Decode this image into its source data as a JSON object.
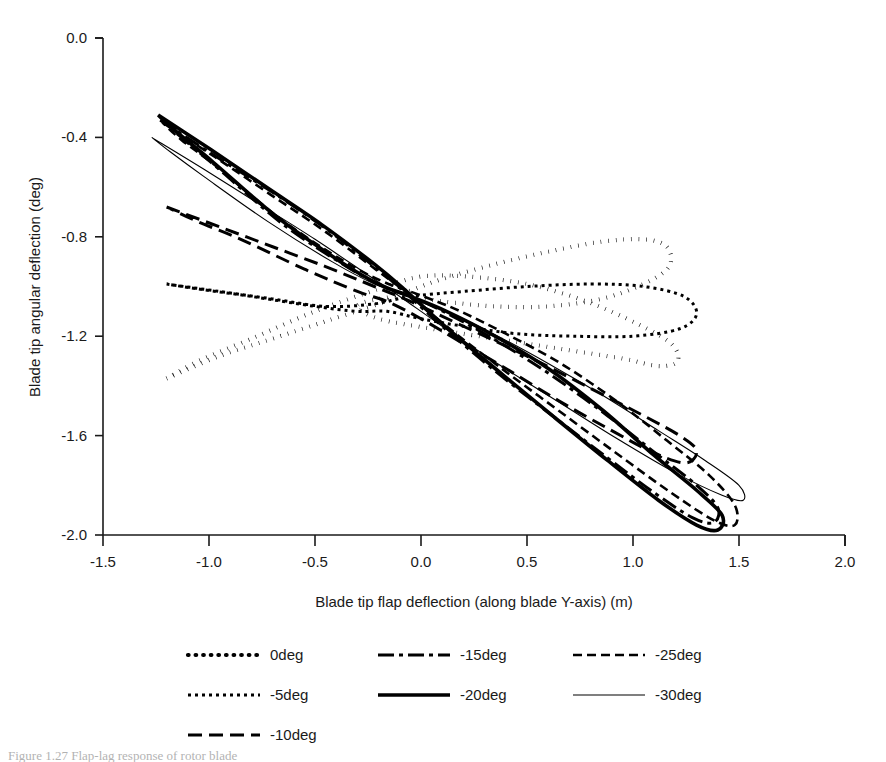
{
  "chart_data": {
    "type": "line",
    "title": "",
    "xlabel": "Blade tip flap deflection (along blade Y-axis) (m)",
    "ylabel": "Blade tip angular deflection (deg)",
    "xlim": [
      -1.5,
      2.0
    ],
    "ylim": [
      -2.0,
      0.0
    ],
    "xticks": [
      "-1.5",
      "-1.0",
      "-0.5",
      "0.0",
      "0.5",
      "1.0",
      "1.5",
      "2.0"
    ],
    "xtick_values": [
      -1.5,
      -1.0,
      -0.5,
      0.0,
      0.5,
      1.0,
      1.5,
      2.0
    ],
    "yticks": [
      "0.0",
      "-0.4",
      "-0.8",
      "-1.2",
      "-1.6",
      "-2.0"
    ],
    "ytick_values": [
      0.0,
      -0.4,
      -0.8,
      -1.2,
      -1.6,
      -2.0
    ],
    "grid": false,
    "legend_position": "bottom",
    "legend_columns": 3,
    "series": [
      {
        "name": "0deg",
        "style": "dotted-bold",
        "description": "bow-tie / figure-eight loop, two lobes extending right",
        "points": [
          [
            -1.2,
            -1.37
          ],
          [
            -0.95,
            -1.28
          ],
          [
            -0.7,
            -1.21
          ],
          [
            -0.45,
            -1.14
          ],
          [
            -0.2,
            -1.07
          ],
          [
            -0.06,
            -1.02
          ],
          [
            0.1,
            -0.97
          ],
          [
            0.35,
            -0.91
          ],
          [
            0.6,
            -0.86
          ],
          [
            0.85,
            -0.82
          ],
          [
            1.05,
            -0.81
          ],
          [
            1.16,
            -0.84
          ],
          [
            1.17,
            -0.92
          ],
          [
            1.05,
            -0.99
          ],
          [
            0.85,
            -1.05
          ],
          [
            0.6,
            -1.08
          ],
          [
            0.35,
            -1.08
          ],
          [
            0.1,
            -1.06
          ],
          [
            -0.06,
            -1.04
          ],
          [
            -0.2,
            -1.05
          ],
          [
            -0.3,
            -1.08
          ],
          [
            -0.2,
            -1.13
          ],
          [
            0.05,
            -1.17
          ],
          [
            0.35,
            -1.21
          ],
          [
            0.65,
            -1.25
          ],
          [
            0.95,
            -1.29
          ],
          [
            1.12,
            -1.32
          ],
          [
            1.21,
            -1.3
          ],
          [
            1.18,
            -1.23
          ],
          [
            1.02,
            -1.15
          ],
          [
            0.78,
            -1.06
          ],
          [
            0.5,
            -0.99
          ],
          [
            0.22,
            -0.96
          ],
          [
            0.0,
            -0.96
          ],
          [
            -0.2,
            -1.01
          ],
          [
            -0.5,
            -1.1
          ],
          [
            -0.8,
            -1.21
          ],
          [
            -1.05,
            -1.3
          ],
          [
            -1.2,
            -1.37
          ]
        ]
      },
      {
        "name": "-5deg",
        "style": "dotted-fine",
        "description": "narrow flattened loop from upper-left to mid-right",
        "points": [
          [
            -1.2,
            -0.99
          ],
          [
            -0.95,
            -1.02
          ],
          [
            -0.7,
            -1.05
          ],
          [
            -0.45,
            -1.08
          ],
          [
            -0.22,
            -1.07
          ],
          [
            -0.05,
            -1.04
          ],
          [
            0.2,
            -1.02
          ],
          [
            0.5,
            -1.0
          ],
          [
            0.8,
            -0.99
          ],
          [
            1.05,
            -1.0
          ],
          [
            1.24,
            -1.04
          ],
          [
            1.3,
            -1.11
          ],
          [
            1.22,
            -1.17
          ],
          [
            1.0,
            -1.2
          ],
          [
            0.72,
            -1.2
          ],
          [
            0.45,
            -1.19
          ],
          [
            0.2,
            -1.16
          ],
          [
            0.0,
            -1.13
          ],
          [
            -0.16,
            -1.1
          ],
          [
            -0.3,
            -1.1
          ],
          [
            -0.5,
            -1.08
          ],
          [
            -0.8,
            -1.04
          ],
          [
            -1.05,
            -1.01
          ],
          [
            -1.2,
            -0.99
          ]
        ]
      },
      {
        "name": "-10deg",
        "style": "long-dash",
        "description": "elongated loop, descending left to lower-right",
        "points": [
          [
            -1.2,
            -0.68
          ],
          [
            -0.95,
            -0.76
          ],
          [
            -0.7,
            -0.84
          ],
          [
            -0.45,
            -0.92
          ],
          [
            -0.22,
            -1.0
          ],
          [
            -0.05,
            -1.06
          ],
          [
            0.2,
            -1.16
          ],
          [
            0.5,
            -1.28
          ],
          [
            0.8,
            -1.41
          ],
          [
            1.05,
            -1.52
          ],
          [
            1.22,
            -1.6
          ],
          [
            1.3,
            -1.66
          ],
          [
            1.25,
            -1.71
          ],
          [
            1.1,
            -1.67
          ],
          [
            0.9,
            -1.58
          ],
          [
            0.65,
            -1.46
          ],
          [
            0.4,
            -1.33
          ],
          [
            0.18,
            -1.22
          ],
          [
            0.0,
            -1.13
          ],
          [
            -0.16,
            -1.06
          ],
          [
            -0.3,
            -1.02
          ],
          [
            -0.55,
            -0.93
          ],
          [
            -0.85,
            -0.81
          ],
          [
            -1.05,
            -0.74
          ],
          [
            -1.2,
            -0.68
          ]
        ]
      },
      {
        "name": "-15deg",
        "style": "dash-dot",
        "description": "steep elongated loop reaching lower right near -1.95",
        "points": [
          [
            -1.23,
            -0.33
          ],
          [
            -0.98,
            -0.47
          ],
          [
            -0.72,
            -0.61
          ],
          [
            -0.46,
            -0.76
          ],
          [
            -0.22,
            -0.92
          ],
          [
            -0.08,
            -1.02
          ],
          [
            0.1,
            -1.16
          ],
          [
            0.35,
            -1.34
          ],
          [
            0.62,
            -1.52
          ],
          [
            0.88,
            -1.69
          ],
          [
            1.1,
            -1.83
          ],
          [
            1.28,
            -1.93
          ],
          [
            1.38,
            -1.95
          ],
          [
            1.4,
            -1.89
          ],
          [
            1.3,
            -1.8
          ],
          [
            1.12,
            -1.68
          ],
          [
            0.88,
            -1.52
          ],
          [
            0.62,
            -1.36
          ],
          [
            0.38,
            -1.23
          ],
          [
            0.15,
            -1.12
          ],
          [
            -0.02,
            -1.05
          ],
          [
            -0.18,
            -1.0
          ],
          [
            -0.35,
            -0.92
          ],
          [
            -0.65,
            -0.75
          ],
          [
            -0.95,
            -0.53
          ],
          [
            -1.13,
            -0.4
          ],
          [
            -1.23,
            -0.33
          ]
        ]
      },
      {
        "name": "-20deg",
        "style": "solid-bold",
        "description": "thickest solid elongated loop, widest vertical span",
        "points": [
          [
            -1.24,
            -0.31
          ],
          [
            -0.99,
            -0.45
          ],
          [
            -0.73,
            -0.6
          ],
          [
            -0.47,
            -0.75
          ],
          [
            -0.22,
            -0.91
          ],
          [
            -0.08,
            -1.01
          ],
          [
            0.1,
            -1.15
          ],
          [
            0.35,
            -1.33
          ],
          [
            0.62,
            -1.52
          ],
          [
            0.88,
            -1.7
          ],
          [
            1.12,
            -1.86
          ],
          [
            1.3,
            -1.96
          ],
          [
            1.4,
            -1.98
          ],
          [
            1.42,
            -1.92
          ],
          [
            1.3,
            -1.82
          ],
          [
            1.1,
            -1.68
          ],
          [
            0.86,
            -1.5
          ],
          [
            0.6,
            -1.33
          ],
          [
            0.35,
            -1.2
          ],
          [
            0.12,
            -1.1
          ],
          [
            -0.05,
            -1.04
          ],
          [
            -0.2,
            -0.99
          ],
          [
            -0.38,
            -0.9
          ],
          [
            -0.68,
            -0.72
          ],
          [
            -0.98,
            -0.5
          ],
          [
            -1.15,
            -0.38
          ],
          [
            -1.24,
            -0.31
          ]
        ]
      },
      {
        "name": "-25deg",
        "style": "dashed",
        "description": "dashed elongated loop overlapping -20deg, reaching x 1.48",
        "points": [
          [
            -1.22,
            -0.34
          ],
          [
            -0.97,
            -0.48
          ],
          [
            -0.71,
            -0.63
          ],
          [
            -0.45,
            -0.78
          ],
          [
            -0.2,
            -0.94
          ],
          [
            -0.06,
            -1.03
          ],
          [
            0.12,
            -1.16
          ],
          [
            0.38,
            -1.33
          ],
          [
            0.65,
            -1.5
          ],
          [
            0.92,
            -1.67
          ],
          [
            1.18,
            -1.83
          ],
          [
            1.38,
            -1.94
          ],
          [
            1.48,
            -1.96
          ],
          [
            1.48,
            -1.88
          ],
          [
            1.36,
            -1.76
          ],
          [
            1.16,
            -1.62
          ],
          [
            0.92,
            -1.46
          ],
          [
            0.66,
            -1.31
          ],
          [
            0.4,
            -1.19
          ],
          [
            0.16,
            -1.09
          ],
          [
            -0.02,
            -1.03
          ],
          [
            -0.18,
            -0.98
          ],
          [
            -0.36,
            -0.9
          ],
          [
            -0.66,
            -0.73
          ],
          [
            -0.96,
            -0.52
          ],
          [
            -1.13,
            -0.41
          ],
          [
            -1.22,
            -0.34
          ]
        ]
      },
      {
        "name": "-30deg",
        "style": "solid-thin",
        "description": "thin solid loop, slimmest, tip reaching x 1.52",
        "points": [
          [
            -1.27,
            -0.4
          ],
          [
            -1.02,
            -0.53
          ],
          [
            -0.76,
            -0.67
          ],
          [
            -0.5,
            -0.81
          ],
          [
            -0.24,
            -0.96
          ],
          [
            -0.1,
            -1.04
          ],
          [
            0.1,
            -1.16
          ],
          [
            0.36,
            -1.31
          ],
          [
            0.64,
            -1.46
          ],
          [
            0.92,
            -1.61
          ],
          [
            1.2,
            -1.75
          ],
          [
            1.42,
            -1.84
          ],
          [
            1.52,
            -1.86
          ],
          [
            1.5,
            -1.8
          ],
          [
            1.34,
            -1.7
          ],
          [
            1.12,
            -1.58
          ],
          [
            0.86,
            -1.44
          ],
          [
            0.6,
            -1.31
          ],
          [
            0.34,
            -1.19
          ],
          [
            0.12,
            -1.1
          ],
          [
            -0.06,
            -1.04
          ],
          [
            -0.22,
            -0.99
          ],
          [
            -0.42,
            -0.9
          ],
          [
            -0.72,
            -0.74
          ],
          [
            -1.02,
            -0.56
          ],
          [
            -1.18,
            -0.46
          ],
          [
            -1.27,
            -0.4
          ]
        ]
      }
    ],
    "legend": [
      {
        "label": "0deg",
        "style": "dotted-bold",
        "column": 1,
        "row": 1
      },
      {
        "label": "-5deg",
        "style": "dotted-fine",
        "column": 1,
        "row": 2
      },
      {
        "label": "-10deg",
        "style": "long-dash",
        "column": 1,
        "row": 3
      },
      {
        "label": "-15deg",
        "style": "dash-dot",
        "column": 2,
        "row": 1
      },
      {
        "label": "-20deg",
        "style": "solid-bold",
        "column": 2,
        "row": 2
      },
      {
        "label": "-25deg",
        "style": "dashed",
        "column": 3,
        "row": 1
      },
      {
        "label": "-30deg",
        "style": "solid-thin",
        "column": 3,
        "row": 2
      }
    ]
  },
  "colors": {
    "line": "#000000",
    "axis": "#1a1a1a",
    "background": "#ffffff"
  }
}
